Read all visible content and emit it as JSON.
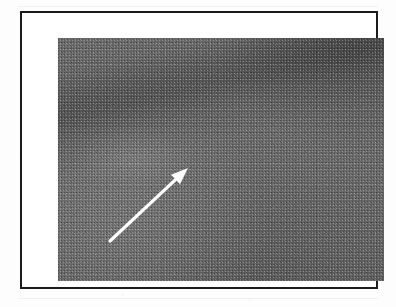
{
  "figure": {
    "type": "scanned-photograph",
    "caption": "",
    "frame": {
      "border_color": "#1b1b1b",
      "border_width_px": 2,
      "mat_color": "#ffffff"
    },
    "photo": {
      "description": "Grainy monochrome photograph of a dark textured surface with a diffuse darker diagonal band running from the lower-left toward the upper-right corner",
      "base_color": "#6a6a6a",
      "dark_band_color": "#4e4e4e",
      "highlight_color": "#7b7b7b",
      "width_px": 326,
      "height_px": 243
    },
    "annotations": [
      {
        "id": "arrow-1",
        "kind": "arrow",
        "color": "#ffffff",
        "direction": "up-right",
        "tail_px": [
          52,
          203
        ],
        "tip_px": [
          130,
          130
        ],
        "shaft_width_px": 3.2,
        "label": ""
      }
    ]
  },
  "page": {
    "background_color": "#fdfdfd",
    "artifact_note": ""
  }
}
